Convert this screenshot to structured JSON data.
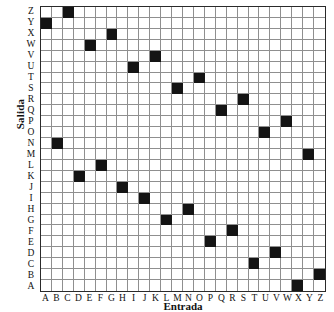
{
  "chart_data": {
    "type": "heatmap",
    "title": "",
    "subtitle": "",
    "xlabel": "Entrada",
    "ylabel": "Salida",
    "grid": true,
    "legend": "none",
    "marker_color": "#141414",
    "grid_line_color": "#8f8f8f",
    "border_color": "#2a2a2a",
    "background_color": "#ffffff",
    "x_categories": [
      "A",
      "B",
      "C",
      "D",
      "E",
      "F",
      "G",
      "H",
      "I",
      "J",
      "K",
      "L",
      "M",
      "N",
      "O",
      "P",
      "Q",
      "R",
      "S",
      "T",
      "U",
      "V",
      "W",
      "X",
      "Y",
      "Z"
    ],
    "y_categories_top_to_bottom": [
      "Z",
      "Y",
      "X",
      "W",
      "V",
      "U",
      "T",
      "S",
      "R",
      "Q",
      "P",
      "O",
      "N",
      "M",
      "L",
      "K",
      "J",
      "I",
      "H",
      "G",
      "F",
      "E",
      "D",
      "C",
      "B",
      "A"
    ],
    "xlim": [
      0,
      26
    ],
    "ylim": [
      0,
      26
    ],
    "mapping_input_to_output": {
      "A": "Y",
      "B": "N",
      "C": "Z",
      "D": "K",
      "E": "W",
      "F": "L",
      "G": "X",
      "H": "J",
      "I": "U",
      "J": "I",
      "K": "V",
      "L": "G",
      "M": "S",
      "N": "H",
      "O": "T",
      "P": "E",
      "Q": "Q",
      "R": "F",
      "S": "R",
      "T": "C",
      "U": "O",
      "V": "D",
      "W": "P",
      "X": "A",
      "Y": "M",
      "Z": "B"
    },
    "filled_cells_row_top_to_bottom": [
      {
        "row_label": "Z",
        "col_label": "C",
        "row_index": 0,
        "col_index": 2
      },
      {
        "row_label": "Y",
        "col_label": "A",
        "row_index": 1,
        "col_index": 0
      },
      {
        "row_label": "X",
        "col_label": "G",
        "row_index": 2,
        "col_index": 6
      },
      {
        "row_label": "W",
        "col_label": "E",
        "row_index": 3,
        "col_index": 4
      },
      {
        "row_label": "V",
        "col_label": "K",
        "row_index": 4,
        "col_index": 10
      },
      {
        "row_label": "U",
        "col_label": "I",
        "row_index": 5,
        "col_index": 8
      },
      {
        "row_label": "T",
        "col_label": "O",
        "row_index": 6,
        "col_index": 14
      },
      {
        "row_label": "S",
        "col_label": "M",
        "row_index": 7,
        "col_index": 12
      },
      {
        "row_label": "R",
        "col_label": "S",
        "row_index": 8,
        "col_index": 18
      },
      {
        "row_label": "Q",
        "col_label": "Q",
        "row_index": 9,
        "col_index": 16
      },
      {
        "row_label": "P",
        "col_label": "W",
        "row_index": 10,
        "col_index": 22
      },
      {
        "row_label": "O",
        "col_label": "U",
        "row_index": 11,
        "col_index": 20
      },
      {
        "row_label": "N",
        "col_label": "B",
        "row_index": 12,
        "col_index": 1
      },
      {
        "row_label": "M",
        "col_label": "Y",
        "row_index": 13,
        "col_index": 24
      },
      {
        "row_label": "L",
        "col_label": "F",
        "row_index": 14,
        "col_index": 5
      },
      {
        "row_label": "K",
        "col_label": "D",
        "row_index": 15,
        "col_index": 3
      },
      {
        "row_label": "J",
        "col_label": "H",
        "row_index": 16,
        "col_index": 7
      },
      {
        "row_label": "I",
        "col_label": "J",
        "row_index": 17,
        "col_index": 9
      },
      {
        "row_label": "H",
        "col_label": "N",
        "row_index": 18,
        "col_index": 13
      },
      {
        "row_label": "G",
        "col_label": "L",
        "row_index": 19,
        "col_index": 11
      },
      {
        "row_label": "F",
        "col_label": "R",
        "row_index": 20,
        "col_index": 17
      },
      {
        "row_label": "E",
        "col_label": "P",
        "row_index": 21,
        "col_index": 15
      },
      {
        "row_label": "D",
        "col_label": "V",
        "row_index": 22,
        "col_index": 21
      },
      {
        "row_label": "C",
        "col_label": "T",
        "row_index": 23,
        "col_index": 19
      },
      {
        "row_label": "B",
        "col_label": "Z",
        "row_index": 24,
        "col_index": 25
      },
      {
        "row_label": "A",
        "col_label": "X",
        "row_index": 25,
        "col_index": 23
      }
    ]
  }
}
